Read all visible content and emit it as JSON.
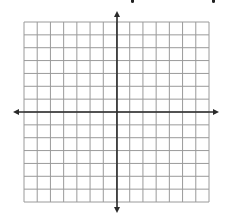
{
  "diagram": {
    "type": "coordinate-plane",
    "grid": {
      "columns": 14,
      "rows": 14,
      "left": 24,
      "top": 22,
      "right": 209,
      "bottom": 202,
      "line_color": "#9a9a9a",
      "line_width": 1
    },
    "axes": {
      "color": "#2a2a2a",
      "line_width": 1.6,
      "origin_x": 117,
      "origin_y": 112,
      "x_axis": {
        "left_tip": 13,
        "right_tip": 219
      },
      "y_axis": {
        "top_tip": 11,
        "bottom_tip": 213
      },
      "arrows": [
        "left",
        "right",
        "up",
        "down"
      ]
    },
    "clipped_header_fragments": [
      {
        "x": 131
      },
      {
        "x": 212
      }
    ]
  }
}
